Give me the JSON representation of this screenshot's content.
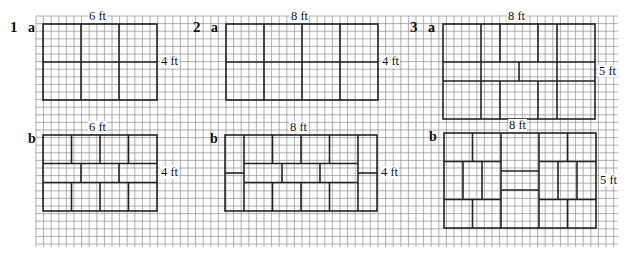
{
  "grid": {
    "x0": 36,
    "y0": 16,
    "x1": 618,
    "y1": 247,
    "cell": 7.6,
    "line_color": "#9a9a9a",
    "rect_stroke": "#222222"
  },
  "scale_px_per_ft": 19,
  "problems": [
    {
      "number": "1",
      "parts": [
        {
          "part": "a",
          "width_ft": 6,
          "height_ft": 4,
          "width_label": "6 ft",
          "height_label": "4 ft",
          "origin": [
            43,
            24
          ],
          "segments": [
            [
              2,
              0,
              2,
              4
            ],
            [
              4,
              0,
              4,
              4
            ],
            [
              0,
              2,
              6,
              2
            ]
          ]
        },
        {
          "part": "b",
          "width_ft": 6,
          "height_ft": 4,
          "width_label": "6 ft",
          "height_label": "4 ft",
          "origin": [
            43,
            135
          ],
          "segments": [
            [
              0,
              1.5,
              6,
              1.5
            ],
            [
              0,
              2.5,
              6,
              2.5
            ],
            [
              1.5,
              0,
              1.5,
              1.5
            ],
            [
              3,
              0,
              3,
              1.5
            ],
            [
              4.5,
              0,
              4.5,
              1.5
            ],
            [
              2,
              1.5,
              2,
              2.5
            ],
            [
              4,
              1.5,
              4,
              2.5
            ],
            [
              1.5,
              2.5,
              1.5,
              4
            ],
            [
              3,
              2.5,
              3,
              4
            ],
            [
              4.5,
              2.5,
              4.5,
              4
            ]
          ]
        }
      ]
    },
    {
      "number": "2",
      "parts": [
        {
          "part": "a",
          "width_ft": 8,
          "height_ft": 4,
          "width_label": "8 ft",
          "height_label": "4 ft",
          "origin": [
            226,
            24
          ],
          "segments": [
            [
              2,
              0,
              2,
              4
            ],
            [
              4,
              0,
              4,
              4
            ],
            [
              6,
              0,
              6,
              4
            ],
            [
              0,
              2,
              8,
              2
            ]
          ]
        },
        {
          "part": "b",
          "width_ft": 8,
          "height_ft": 4,
          "width_label": "8 ft",
          "height_label": "4 ft",
          "origin": [
            225,
            135
          ],
          "segments": [
            [
              1,
              0,
              1,
              4
            ],
            [
              7,
              0,
              7,
              4
            ],
            [
              0,
              2,
              1,
              2
            ],
            [
              7,
              2,
              8,
              2
            ],
            [
              1,
              1.5,
              7,
              1.5
            ],
            [
              1,
              2.5,
              7,
              2.5
            ],
            [
              2.5,
              0,
              2.5,
              1.5
            ],
            [
              4,
              0,
              4,
              1.5
            ],
            [
              5.5,
              0,
              5.5,
              1.5
            ],
            [
              3,
              1.5,
              3,
              2.5
            ],
            [
              5,
              1.5,
              5,
              2.5
            ],
            [
              2.5,
              2.5,
              2.5,
              4
            ],
            [
              4,
              2.5,
              4,
              4
            ],
            [
              5.5,
              2.5,
              5.5,
              4
            ]
          ]
        }
      ]
    },
    {
      "number": "3",
      "parts": [
        {
          "part": "a",
          "width_ft": 8,
          "height_ft": 5,
          "width_label": "8 ft",
          "height_label": "5 ft",
          "origin": [
            443,
            24
          ],
          "segments": [
            [
              0,
              2,
              8,
              2
            ],
            [
              0,
              3,
              8,
              3
            ],
            [
              2,
              0,
              2,
              5
            ],
            [
              3,
              0,
              3,
              2
            ],
            [
              5,
              0,
              5,
              2
            ],
            [
              6,
              0,
              6,
              5
            ],
            [
              4,
              2,
              4,
              3
            ],
            [
              3,
              3,
              3,
              5
            ],
            [
              5,
              3,
              5,
              5
            ]
          ]
        },
        {
          "part": "b",
          "width_ft": 8,
          "height_ft": 5,
          "width_label": "8 ft",
          "height_label": "5 ft",
          "origin": [
            444,
            133
          ],
          "segments": [
            [
              3,
              0,
              3,
              5
            ],
            [
              5,
              0,
              5,
              5
            ],
            [
              0,
              1.5,
              3,
              1.5
            ],
            [
              5,
              1.5,
              8,
              1.5
            ],
            [
              0,
              3.5,
              3,
              3.5
            ],
            [
              5,
              3.5,
              8,
              3.5
            ],
            [
              1.5,
              0,
              1.5,
              1.5
            ],
            [
              6.5,
              0,
              6.5,
              1.5
            ],
            [
              1,
              1.5,
              1,
              3.5
            ],
            [
              2,
              1.5,
              2,
              3.5
            ],
            [
              6,
              1.5,
              6,
              3.5
            ],
            [
              7,
              1.5,
              7,
              3.5
            ],
            [
              1.5,
              3.5,
              1.5,
              5
            ],
            [
              6.5,
              3.5,
              6.5,
              5
            ],
            [
              3,
              2,
              5,
              2
            ],
            [
              3,
              3,
              5,
              3
            ]
          ]
        }
      ]
    }
  ]
}
